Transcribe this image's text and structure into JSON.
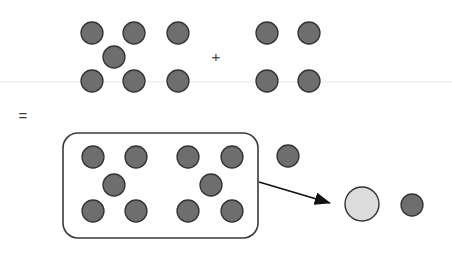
{
  "diagram": {
    "canvas": {
      "width": 452,
      "height": 256,
      "background": "#ffffff"
    },
    "colors": {
      "unit_fill": "#6e6e6e",
      "unit_stroke": "#333333",
      "result_fill": "#dcdcdc",
      "result_stroke": "#333333",
      "box_stroke": "#3a3a3a",
      "arrow": "#111111",
      "baseline": "#f0eeee",
      "symbol": "#3a3a3a"
    },
    "operators": {
      "plus": {
        "label": "+",
        "x": 216,
        "y": 57
      },
      "equals": {
        "label": "=",
        "x": 23,
        "y": 116
      }
    },
    "baseline": {
      "y": 82,
      "x1": 0,
      "x2": 452
    },
    "groups": [
      {
        "name": "addend-left",
        "count": 7,
        "circles": [
          {
            "cx": 92,
            "cy": 33,
            "r": 11
          },
          {
            "cx": 134,
            "cy": 33,
            "r": 11
          },
          {
            "cx": 178,
            "cy": 33,
            "r": 11
          },
          {
            "cx": 114,
            "cy": 57,
            "r": 11
          },
          {
            "cx": 92,
            "cy": 81,
            "r": 11
          },
          {
            "cx": 134,
            "cy": 81,
            "r": 11
          },
          {
            "cx": 178,
            "cy": 81,
            "r": 11
          }
        ]
      },
      {
        "name": "addend-right",
        "count": 4,
        "circles": [
          {
            "cx": 267,
            "cy": 33,
            "r": 11
          },
          {
            "cx": 309,
            "cy": 33,
            "r": 11
          },
          {
            "cx": 267,
            "cy": 81,
            "r": 11
          },
          {
            "cx": 309,
            "cy": 81,
            "r": 11
          }
        ]
      },
      {
        "name": "sum-boxed-group",
        "count": 10,
        "circles": [
          {
            "cx": 93,
            "cy": 157,
            "r": 11
          },
          {
            "cx": 136,
            "cy": 157,
            "r": 11
          },
          {
            "cx": 114,
            "cy": 185,
            "r": 11
          },
          {
            "cx": 93,
            "cy": 211,
            "r": 11
          },
          {
            "cx": 136,
            "cy": 211,
            "r": 11
          },
          {
            "cx": 188,
            "cy": 157,
            "r": 11
          },
          {
            "cx": 232,
            "cy": 157,
            "r": 11
          },
          {
            "cx": 211,
            "cy": 185,
            "r": 11
          },
          {
            "cx": 188,
            "cy": 211,
            "r": 11
          },
          {
            "cx": 232,
            "cy": 211,
            "r": 11
          }
        ]
      },
      {
        "name": "sum-remainder",
        "count": 1,
        "circles": [
          {
            "cx": 288,
            "cy": 156,
            "r": 11
          }
        ]
      },
      {
        "name": "regrouped-result",
        "count": 2,
        "circles": [
          {
            "cx": 362,
            "cy": 204,
            "r": 17,
            "variant": "large-light"
          },
          {
            "cx": 412,
            "cy": 205,
            "r": 11,
            "variant": "unit"
          }
        ]
      }
    ],
    "group_box": {
      "name": "ten-group-box",
      "x": 63,
      "y": 133,
      "width": 195,
      "height": 105,
      "rx": 15
    },
    "arrow": {
      "name": "regroup-arrow",
      "x1": 259,
      "y1": 182,
      "x2": 332,
      "y2": 204
    }
  }
}
